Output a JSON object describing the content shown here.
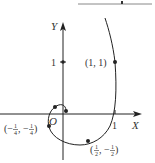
{
  "figure": {
    "axes": {
      "x_label": "X",
      "y_label": "Y",
      "origin_label": "O",
      "x_tick": "1",
      "y_tick": "1"
    },
    "points": [
      {
        "label": "(1, 1)",
        "x": 1,
        "y": 1
      },
      {
        "label_main": "(",
        "num1": "1",
        "den1": "2",
        "sep": ", −",
        "num2": "1",
        "den2": "2",
        "close": ")",
        "x": 0.5,
        "y": -0.5
      },
      {
        "label_main": "(−",
        "num1": "1",
        "den1": "4",
        "sep": ", −",
        "num2": "1",
        "den2": "4",
        "close": ")",
        "x": -0.25,
        "y": -0.25
      }
    ],
    "colors": {
      "ink": "#222222",
      "background": "#ffffff"
    }
  }
}
